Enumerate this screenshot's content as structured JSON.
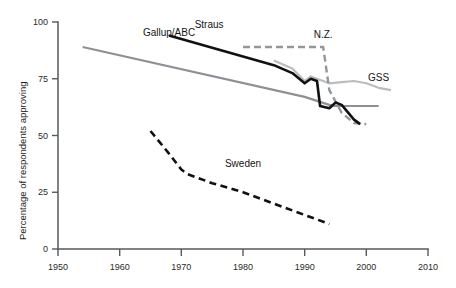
{
  "chart_data": {
    "type": "line",
    "title": "",
    "subtitle": "",
    "xlabel": "",
    "ylabel": "Percentage of respondents approving",
    "xlim": [
      1950,
      2010
    ],
    "ylim": [
      0,
      100
    ],
    "xticks": [
      1950,
      1960,
      1970,
      1980,
      1990,
      2000,
      2010
    ],
    "xtick_labels": [
      "1950",
      "1960",
      "1970",
      "1980",
      "1990",
      "2000",
      "2010"
    ],
    "yticks": [
      0,
      25,
      50,
      75,
      100
    ],
    "ytick_labels": [
      "0",
      "25",
      "50",
      "75",
      "100"
    ],
    "grid": false,
    "legend_position": "inline-annotations",
    "series": [
      {
        "name": "Gallup/ABC",
        "style": "solid",
        "color": "#8d9195",
        "label_x": 1968,
        "label_y": 94,
        "points": [
          [
            1954,
            89.0
          ],
          [
            1990,
            67.0
          ],
          [
            1994,
            63.5
          ],
          [
            1995,
            63.0
          ],
          [
            2002,
            63.0
          ]
        ]
      },
      {
        "name": "Straus",
        "style": "solid",
        "color": "#111111",
        "label_x": 1974.5,
        "label_y": 97.5,
        "points": [
          [
            1968,
            94.0
          ],
          [
            1985,
            81.0
          ],
          [
            1988,
            77.5
          ],
          [
            1990,
            73.0
          ],
          [
            1991,
            75.0
          ],
          [
            1992,
            74.0
          ],
          [
            1992.5,
            63.0
          ],
          [
            1994,
            62.0
          ],
          [
            1995,
            64.5
          ],
          [
            1996,
            63.5
          ],
          [
            1998,
            57.0
          ],
          [
            1999,
            55.0
          ]
        ]
      },
      {
        "name": "N.Z.",
        "style": "dashed",
        "color": "#93979b",
        "label_x": 1993,
        "label_y": 93,
        "points": [
          [
            1980,
            89.0
          ],
          [
            1993,
            89.0
          ],
          [
            1994,
            70.0
          ],
          [
            1996,
            60.0
          ],
          [
            1998,
            55.5
          ],
          [
            2000,
            55.0
          ]
        ]
      },
      {
        "name": "GSS",
        "style": "solid",
        "color": "#b9bdc0",
        "label_x": 2002,
        "label_y": 74,
        "points": [
          [
            1985,
            83.0
          ],
          [
            1988,
            79.5
          ],
          [
            1990,
            74.0
          ],
          [
            1991,
            76.0
          ],
          [
            1992,
            75.0
          ],
          [
            1994,
            73.0
          ],
          [
            1996,
            73.5
          ],
          [
            1998,
            74.0
          ],
          [
            2000,
            73.0
          ],
          [
            2002,
            71.0
          ],
          [
            2004,
            70.0
          ]
        ]
      },
      {
        "name": "Sweden",
        "style": "dashed",
        "color": "#111111",
        "label_x": 1980,
        "label_y": 36,
        "points": [
          [
            1965,
            52.0
          ],
          [
            1968,
            42.0
          ],
          [
            1970,
            35.0
          ],
          [
            1971,
            33.0
          ],
          [
            1975,
            29.0
          ],
          [
            1980,
            25.0
          ],
          [
            1985,
            20.0
          ],
          [
            1990,
            15.0
          ],
          [
            1994,
            11.0
          ]
        ]
      }
    ]
  },
  "labels": {
    "gallup": "Gallup/ABC",
    "straus": "Straus",
    "nz": "N.Z.",
    "gss": "GSS",
    "sweden": "Sweden",
    "yaxis": "Percentage of respondents approving"
  }
}
